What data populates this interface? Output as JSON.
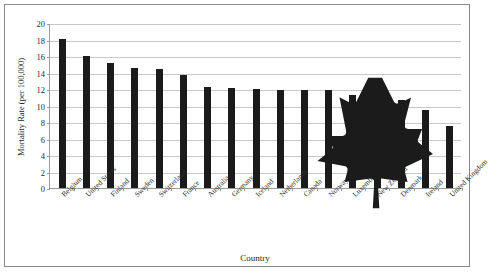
{
  "chart_data": {
    "type": "bar",
    "title": "",
    "xlabel": "Country",
    "ylabel": "Mortality Rate (per 100,000)",
    "ylim": [
      0,
      20
    ],
    "ytick_step": 2,
    "yticks": [
      0,
      2,
      4,
      6,
      8,
      10,
      12,
      14,
      16,
      18,
      20
    ],
    "grid": true,
    "legend": "none",
    "bar_color": "#1b1b1b",
    "categories": [
      "Belgium",
      "United States",
      "Finland",
      "Sweden",
      "Switzerland",
      "France",
      "Australia",
      "Germany",
      "Iceland",
      "Netherlands",
      "Canada",
      "Norway",
      "Luxembourg",
      "New Zealand",
      "Denmark",
      "Ireland",
      "United Kingdom"
    ],
    "values": [
      18.1,
      16.0,
      15.2,
      14.6,
      14.4,
      13.7,
      12.3,
      12.1,
      12.0,
      11.9,
      11.9,
      11.9,
      11.3,
      11.1,
      10.7,
      9.4,
      7.5
    ],
    "annotations": [
      {
        "name": "maple-leaf-marker",
        "category": "Canada",
        "icon": "maple-leaf-icon",
        "color": "#1b1b1b"
      }
    ]
  }
}
